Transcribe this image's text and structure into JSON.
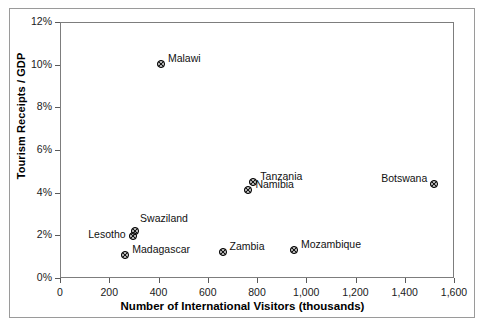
{
  "chart_data": {
    "type": "scatter",
    "title": "",
    "xlabel": "Number of International Visitors (thousands)",
    "ylabel": "Tourism Receipts / GDP",
    "xlim": [
      0,
      1600
    ],
    "ylim": [
      0,
      12
    ],
    "xticks": [
      "0",
      "200",
      "400",
      "600",
      "800",
      "1,000",
      "1,200",
      "1,400",
      "1,600"
    ],
    "xtick_values": [
      0,
      200,
      400,
      600,
      800,
      1000,
      1200,
      1400,
      1600
    ],
    "yticks": [
      "0%",
      "2%",
      "4%",
      "6%",
      "8%",
      "10%",
      "12%"
    ],
    "ytick_values": [
      0,
      2,
      4,
      6,
      8,
      10,
      12
    ],
    "grid": false,
    "legend": "none",
    "marker_style": "circle-with-x",
    "points": [
      {
        "name": "Malawi",
        "x": 410,
        "y": 10.3,
        "label_pos": "right"
      },
      {
        "name": "Tanzania",
        "x": 785,
        "y": 4.8,
        "label_pos": "right"
      },
      {
        "name": "Namibia",
        "x": 765,
        "y": 4.4,
        "label_pos": "right"
      },
      {
        "name": "Botswana",
        "x": 1520,
        "y": 4.7,
        "label_pos": "left"
      },
      {
        "name": "Swaziland",
        "x": 305,
        "y": 2.5,
        "label_pos": "upright"
      },
      {
        "name": "Lesotho",
        "x": 295,
        "y": 2.25,
        "label_pos": "leftlow"
      },
      {
        "name": "Madagascar",
        "x": 265,
        "y": 1.35,
        "label_pos": "right"
      },
      {
        "name": "Zambia",
        "x": 660,
        "y": 1.5,
        "label_pos": "right"
      },
      {
        "name": "Mozambique",
        "x": 950,
        "y": 1.6,
        "label_pos": "right"
      }
    ]
  },
  "colors": {
    "axis": "#7d7d7d",
    "frame": "#9a9a9a",
    "marker": "#111111",
    "text": "#111111",
    "background": "#ffffff"
  }
}
